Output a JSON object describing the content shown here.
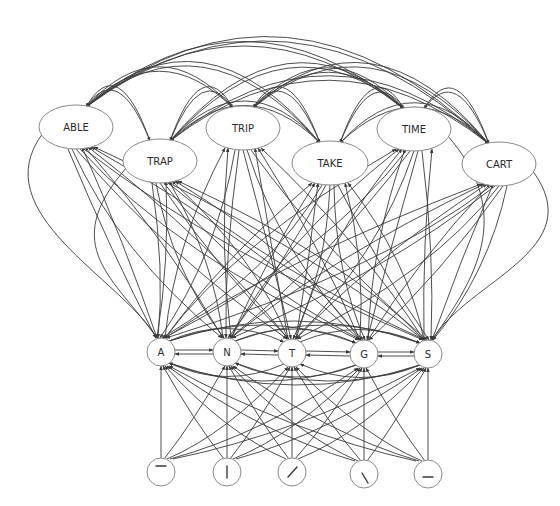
{
  "diagram": {
    "type": "interactive-activation-network",
    "colors": {
      "edge": "#3a3a3a",
      "node_border": "#8a8a8a",
      "node_fill": "#ffffff",
      "text": "#2a2a2a"
    },
    "word_layer": {
      "nodes": [
        {
          "id": "ABLE",
          "label": "ABLE",
          "cx": 76,
          "cy": 127,
          "rx": 37,
          "ry": 22
        },
        {
          "id": "TRAP",
          "label": "TRAP",
          "cx": 160,
          "cy": 161,
          "rx": 37,
          "ry": 22
        },
        {
          "id": "TRIP",
          "label": "TRIP",
          "cx": 243,
          "cy": 128,
          "rx": 37,
          "ry": 22
        },
        {
          "id": "TAKE",
          "label": "TAKE",
          "cx": 330,
          "cy": 163,
          "rx": 38,
          "ry": 22
        },
        {
          "id": "TIME",
          "label": "TIME",
          "cx": 414,
          "cy": 129,
          "rx": 37,
          "ry": 22
        },
        {
          "id": "CART",
          "label": "CART",
          "cx": 499,
          "cy": 164,
          "rx": 37,
          "ry": 22
        }
      ]
    },
    "letter_layer": {
      "nodes": [
        {
          "id": "A",
          "label": "A",
          "cx": 161,
          "cy": 352,
          "r": 14
        },
        {
          "id": "N",
          "label": "N",
          "cx": 227,
          "cy": 352,
          "r": 14
        },
        {
          "id": "T",
          "label": "T",
          "cx": 292,
          "cy": 353,
          "r": 14
        },
        {
          "id": "G",
          "label": "G",
          "cx": 364,
          "cy": 354,
          "r": 14
        },
        {
          "id": "S",
          "label": "S",
          "cx": 428,
          "cy": 354,
          "r": 14
        }
      ]
    },
    "feature_layer": {
      "nodes": [
        {
          "id": "F1",
          "feature": "horizontal-top",
          "cx": 161,
          "cy": 472,
          "r": 14
        },
        {
          "id": "F2",
          "feature": "vertical",
          "cx": 227,
          "cy": 472,
          "r": 14
        },
        {
          "id": "F3",
          "feature": "diagonal-right",
          "cx": 292,
          "cy": 472,
          "r": 14
        },
        {
          "id": "F4",
          "feature": "diagonal-left",
          "cx": 364,
          "cy": 474,
          "r": 14
        },
        {
          "id": "F5",
          "feature": "horizontal-bottom",
          "cx": 428,
          "cy": 474,
          "r": 14
        }
      ]
    },
    "connections": {
      "word_word": "all-to-all (inhibitory, curved arcs above word layer)",
      "letter_word": "all-to-all (bidirectional)",
      "letter_letter": "all-to-all (arrows between neighbors and arcs)",
      "feature_letter": "all-to-all (feature to letter)"
    }
  }
}
